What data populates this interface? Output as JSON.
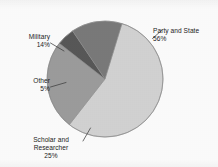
{
  "chart_data": {
    "type": "pie",
    "title": "",
    "subtitle": "",
    "xlabel": "",
    "ylabel": "",
    "legend_position": "none",
    "labels_position": "outside-with-leader-lines",
    "grid": false,
    "categories": [
      "Party and State",
      "Scholar and Researcher",
      "Other",
      "Military"
    ],
    "values": [
      56,
      25,
      5,
      14
    ],
    "unit": "%",
    "total": 100,
    "slices": [
      {
        "name": "Party and State",
        "label": "Party and State",
        "value": 56,
        "value_label": "56%",
        "color": "#d5d5d5",
        "start_angle_deg": 17,
        "end_angle_deg": 218
      },
      {
        "name": "Scholar and Researcher",
        "label_line1": "Scholar and",
        "label_line2": "Researcher",
        "value": 25,
        "value_label": "25%",
        "color": "#9e9e9e",
        "start_angle_deg": 218,
        "end_angle_deg": 308
      },
      {
        "name": "Other",
        "label": "Other",
        "value": 5,
        "value_label": "5%",
        "color": "#595959",
        "start_angle_deg": 308,
        "end_angle_deg": 326
      },
      {
        "name": "Military",
        "label": "Military",
        "value": 14,
        "value_label": "14%",
        "color": "#7b7b7b",
        "start_angle_deg": 326,
        "end_angle_deg": 377
      }
    ]
  },
  "labels": {
    "party": {
      "name": "Party and State",
      "pct": "56%"
    },
    "military": {
      "name": "Military",
      "pct": "14%"
    },
    "other": {
      "name": "Other",
      "pct": "5%"
    },
    "scholar": {
      "line1": "Scholar and",
      "line2": "Researcher",
      "pct": "25%"
    }
  },
  "colors": {
    "party_and_state": "#d5d5d5",
    "scholar_and_researcher": "#9e9e9e",
    "other": "#595959",
    "military": "#7b7b7b",
    "outline": "#8c8c8c",
    "leader_line": "#4a4a4a",
    "text": "#1c1c1c",
    "background": "#ffffff"
  },
  "geometry": {
    "center_x": 105,
    "center_y": 79,
    "radius": 58
  }
}
